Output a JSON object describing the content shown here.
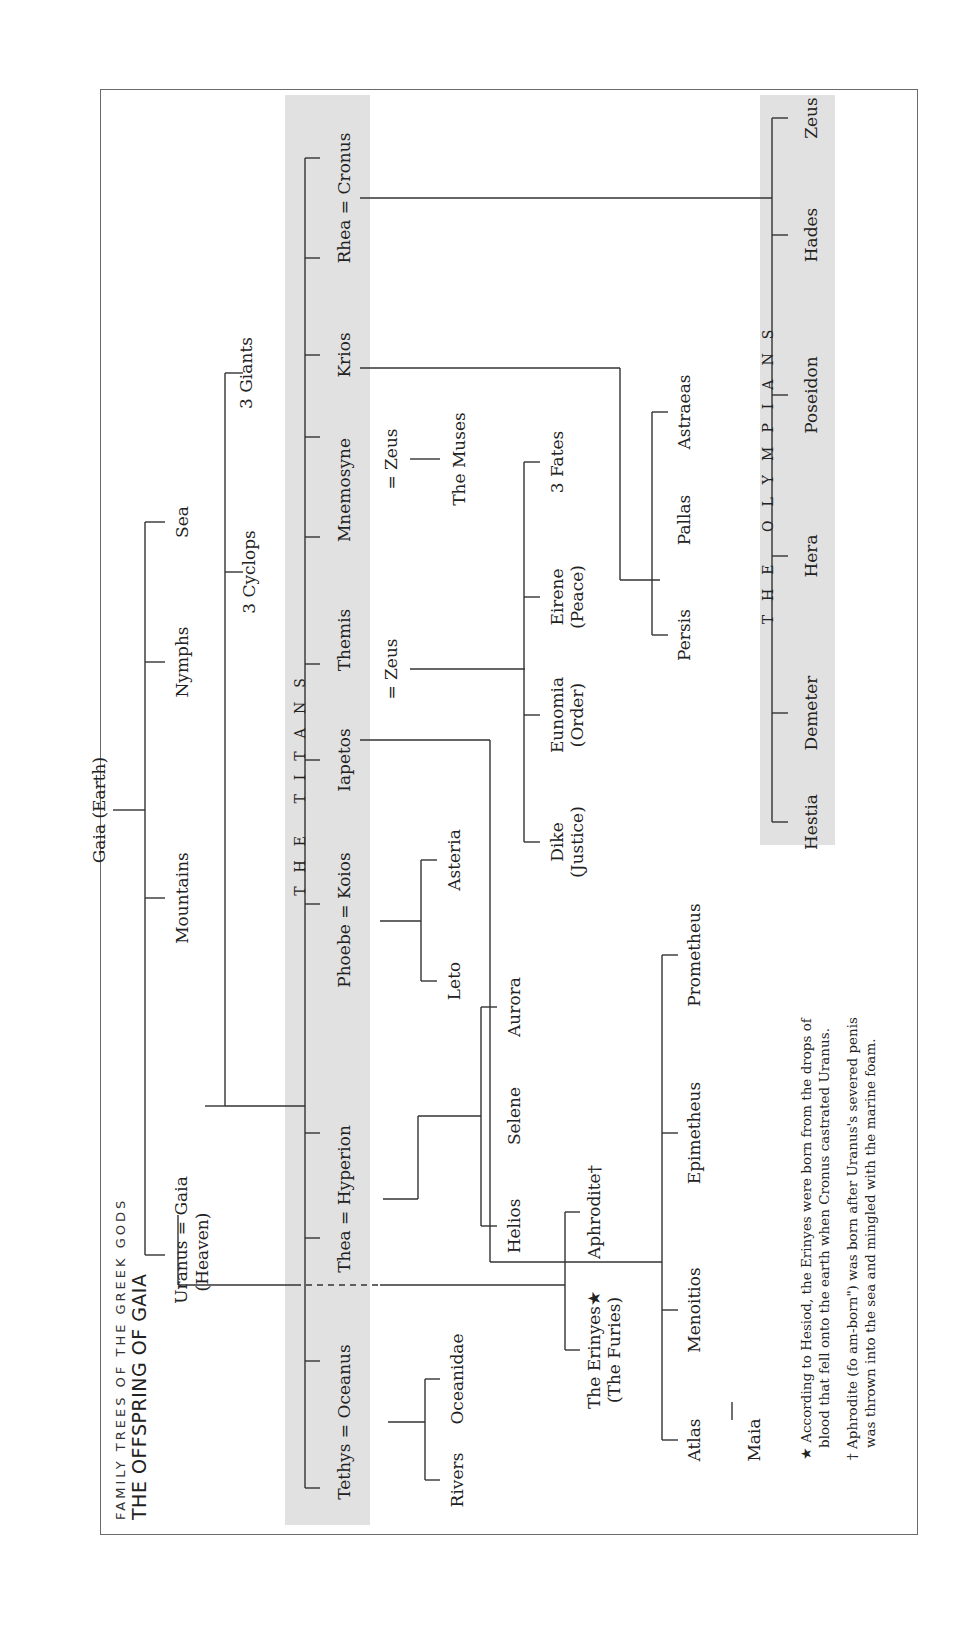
{
  "header": {
    "series_title": "FAMILY TREES OF THE GREEK GODS",
    "title": "THE OFFSPRING OF GAIA"
  },
  "primordial": {
    "gaia": "Gaia (Earth)",
    "mountains": "Mountains",
    "nymphs": "Nymphs",
    "sea": "Sea",
    "uranus_gaia": "Uranus = Gaia",
    "heaven": "(Heaven)",
    "cyclops": "3 Cyclops",
    "giants": "3 Giants"
  },
  "titans": {
    "band_label": "THE TITANS",
    "members": {
      "rhea_cronus": "Rhea = Cronus",
      "krios": "Krios",
      "mnemosyne": "Mnemosyne",
      "themis": "Themis",
      "iapetos": "Iapetos",
      "phoebe_koios": "Phoebe = Koios",
      "thea_hyperion": "Thea = Hyperion",
      "tethys_oceanus": "Tethys = Oceanus"
    }
  },
  "offspring": {
    "zeus_mnemosyne": "= Zeus",
    "muses": "The Muses",
    "zeus_themis": "= Zeus",
    "fates": "3 Fates",
    "eirene": "Eirene",
    "eirene_sub": "(Peace)",
    "eunomia": "Eunomia",
    "eunomia_sub": "(Order)",
    "dike": "Dike",
    "dike_sub": "(Justice)",
    "astraeas": "Astraeas",
    "pallas": "Pallas",
    "persis": "Persis",
    "asteria": "Asteria",
    "leto": "Leto",
    "aurora": "Aurora",
    "selene": "Selene",
    "helios": "Helios",
    "aphrodite": "Aphrodite†",
    "erinyes": "The Erinyes★",
    "furies": "(The Furies)",
    "prometheus": "Prometheus",
    "epimetheus": "Epimetheus",
    "menoitios": "Menoitios",
    "atlas": "Atlas",
    "maia": "Maia",
    "oceanidae": "Oceanidae",
    "rivers": "Rivers"
  },
  "olympians": {
    "band_label": "THE OLYMPIANS",
    "members": {
      "zeus": "Zeus",
      "hades": "Hades",
      "poseidon": "Poseidon",
      "hera": "Hera",
      "demeter": "Demeter",
      "hestia": "Hestia"
    }
  },
  "footnotes": {
    "erinyes_line1": "★ According to Hesiod, the Erinyes were born from the drops of",
    "erinyes_line2": "blood that fell onto the earth when Cronus castrated Uranus.",
    "aphrodite_line1": "† Aphrodite (fo  am-born\") was born after Uranus's severed penis",
    "aphrodite_line2": "was thrown into the sea and mingled with the marine foam."
  },
  "colors": {
    "band": "#e1e1e1",
    "line": "#333333",
    "text": "#222222",
    "frame": "#6a6a6a"
  }
}
